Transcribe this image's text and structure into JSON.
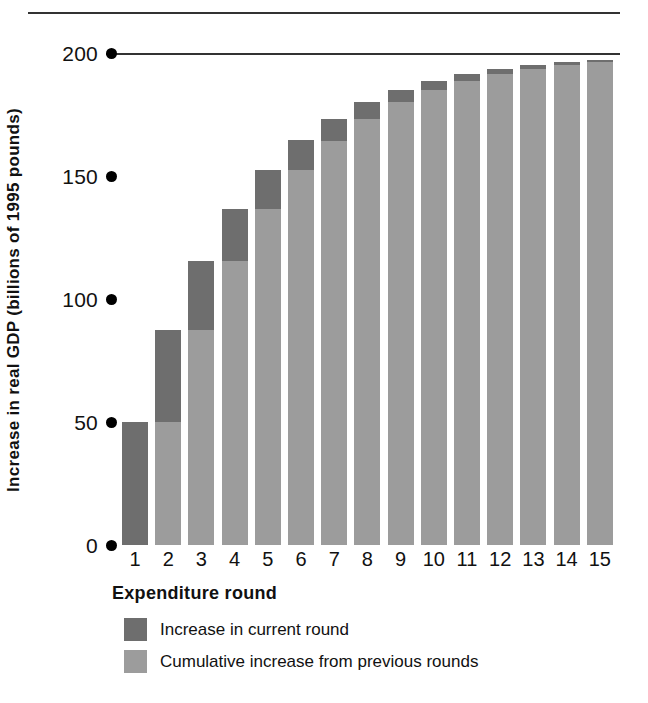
{
  "chart_data": {
    "type": "bar",
    "stacked": true,
    "title": "",
    "xlabel": "Expenditure round",
    "ylabel": "Increase in real GDP (billions of 1995 pounds)",
    "categories": [
      "1",
      "2",
      "3",
      "4",
      "5",
      "6",
      "7",
      "8",
      "9",
      "10",
      "11",
      "12",
      "13",
      "14",
      "15"
    ],
    "ylim": [
      0,
      200
    ],
    "yticks": [
      0,
      50,
      100,
      150,
      200
    ],
    "ytick_labels": [
      "0",
      "50",
      "100",
      "150",
      "200"
    ],
    "grid": false,
    "legend_position": "bottom-left",
    "asymptote": 200,
    "series": [
      {
        "name": "Cumulative increase from previous rounds",
        "color": "#9c9c9c",
        "values": [
          0,
          50.0,
          87.5,
          115.6,
          136.7,
          152.6,
          164.4,
          173.3,
          180.0,
          185.0,
          188.7,
          191.6,
          193.7,
          195.3,
          196.4
        ]
      },
      {
        "name": "Increase in current round",
        "color": "#6e6e6e",
        "values": [
          50.0,
          37.5,
          28.1,
          21.1,
          15.8,
          11.9,
          8.9,
          6.7,
          5.0,
          3.8,
          2.8,
          2.1,
          1.6,
          1.2,
          0.9
        ]
      }
    ],
    "totals": [
      50.0,
      87.5,
      115.6,
      136.7,
      152.6,
      164.4,
      173.3,
      180.0,
      185.0,
      188.7,
      191.6,
      193.7,
      195.3,
      196.4,
      197.3
    ]
  },
  "legend": {
    "items": [
      {
        "label": "Increase in current round",
        "color": "#6e6e6e"
      },
      {
        "label": "Cumulative increase from previous rounds",
        "color": "#9c9c9c"
      }
    ]
  },
  "colors": {
    "current_round": "#6e6e6e",
    "cumulative": "#9c9c9c",
    "axis": "#333333",
    "text": "#111111",
    "background": "#ffffff"
  }
}
